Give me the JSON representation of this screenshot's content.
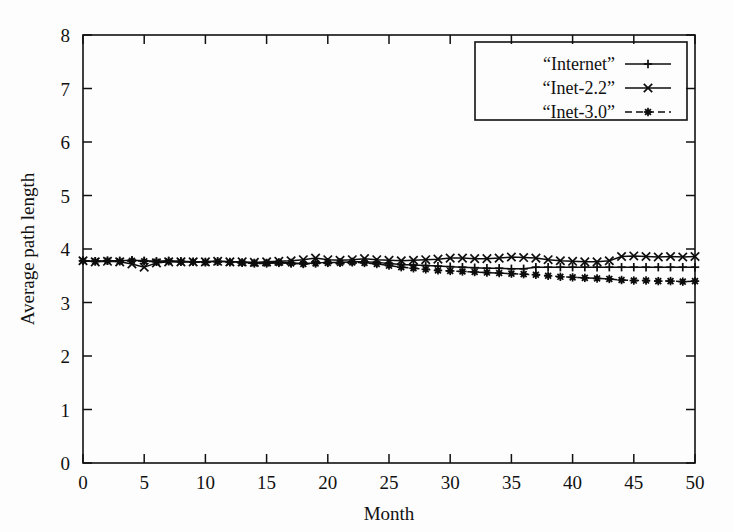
{
  "chart_data": {
    "type": "line",
    "title": "",
    "xlabel": "Month",
    "ylabel": "Average path length",
    "xlim": [
      0,
      50
    ],
    "ylim": [
      0,
      8
    ],
    "xticks": [
      0,
      5,
      10,
      15,
      20,
      25,
      30,
      35,
      40,
      45,
      50
    ],
    "yticks": [
      0,
      1,
      2,
      3,
      4,
      5,
      6,
      7,
      8
    ],
    "grid": false,
    "legend_position": "top-right",
    "x": [
      0,
      1,
      2,
      3,
      4,
      5,
      6,
      7,
      8,
      9,
      10,
      11,
      12,
      13,
      14,
      15,
      16,
      17,
      18,
      19,
      20,
      21,
      22,
      23,
      24,
      25,
      26,
      27,
      28,
      29,
      30,
      31,
      32,
      33,
      34,
      35,
      36,
      37,
      38,
      39,
      40,
      41,
      42,
      43,
      44,
      45,
      46,
      47,
      48,
      49,
      50
    ],
    "series": [
      {
        "name": "“Internet”",
        "marker": "plus",
        "linestyle": "solid",
        "values": [
          3.78,
          3.77,
          3.78,
          3.78,
          3.79,
          3.78,
          3.77,
          3.78,
          3.77,
          3.76,
          3.76,
          3.77,
          3.76,
          3.75,
          3.74,
          3.74,
          3.75,
          3.74,
          3.73,
          3.74,
          3.75,
          3.75,
          3.76,
          3.76,
          3.75,
          3.73,
          3.71,
          3.7,
          3.69,
          3.68,
          3.67,
          3.66,
          3.65,
          3.64,
          3.64,
          3.63,
          3.63,
          3.66,
          3.66,
          3.66,
          3.66,
          3.66,
          3.66,
          3.66,
          3.66,
          3.66,
          3.66,
          3.66,
          3.66,
          3.66,
          3.66
        ]
      },
      {
        "name": "“Inet-2.2”",
        "marker": "cross",
        "linestyle": "solid",
        "values": [
          3.78,
          3.76,
          3.77,
          3.76,
          3.72,
          3.66,
          3.74,
          3.76,
          3.76,
          3.76,
          3.76,
          3.77,
          3.76,
          3.76,
          3.75,
          3.76,
          3.77,
          3.78,
          3.8,
          3.83,
          3.8,
          3.79,
          3.8,
          3.82,
          3.8,
          3.79,
          3.78,
          3.79,
          3.8,
          3.81,
          3.83,
          3.83,
          3.82,
          3.82,
          3.83,
          3.85,
          3.84,
          3.83,
          3.8,
          3.78,
          3.77,
          3.76,
          3.76,
          3.78,
          3.86,
          3.87,
          3.86,
          3.85,
          3.86,
          3.85,
          3.86
        ]
      },
      {
        "name": "“Inet-3.0”",
        "marker": "star",
        "linestyle": "dashed",
        "values": [
          3.78,
          3.77,
          3.78,
          3.77,
          3.78,
          3.77,
          3.76,
          3.77,
          3.76,
          3.76,
          3.75,
          3.76,
          3.75,
          3.74,
          3.73,
          3.73,
          3.74,
          3.73,
          3.72,
          3.73,
          3.74,
          3.74,
          3.75,
          3.74,
          3.72,
          3.69,
          3.66,
          3.64,
          3.62,
          3.6,
          3.59,
          3.58,
          3.57,
          3.56,
          3.55,
          3.54,
          3.53,
          3.52,
          3.5,
          3.48,
          3.47,
          3.46,
          3.45,
          3.44,
          3.42,
          3.41,
          3.41,
          3.4,
          3.4,
          3.39,
          3.4
        ]
      }
    ]
  }
}
